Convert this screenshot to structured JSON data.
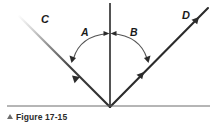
{
  "figure": {
    "caption_marker": "▲",
    "caption_text": "Figure 17-15",
    "labels": {
      "incident_ray": "C",
      "reflected_ray": "D",
      "angle_left": "A",
      "angle_right": "B"
    },
    "colors": {
      "line": "#2b2b2b",
      "normal_line": "#1a1a1a",
      "arc": "#555555",
      "rule": "#6d6d6d",
      "caption": "#2b2b2b",
      "background": "#ffffff",
      "ray_fade": "#dddddd"
    },
    "geometry": {
      "vertex_x": 110,
      "vertex_y": 107,
      "normal_top_y": 3,
      "incident_end_x": 18,
      "incident_end_y": 15,
      "reflected_end_x": 208,
      "reflected_end_y": 8,
      "rule_y": 106
    }
  }
}
